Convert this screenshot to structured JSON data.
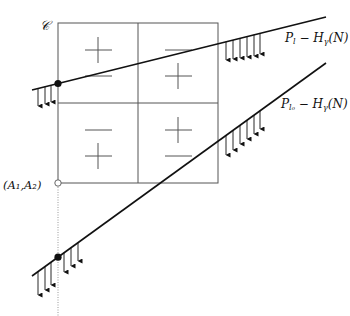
{
  "diagram": {
    "curve_label": "𝒞",
    "point_label": "(A₁,A₂)",
    "line_top": {
      "label_main": "P",
      "label_sub": "l",
      "label_rest": " − H",
      "label_rest_sub": "γ",
      "label_tail": "(N)"
    },
    "line_bottom": {
      "label_main": "P",
      "label_sub": "l₀",
      "label_rest": " − H",
      "label_rest_sub": "γ",
      "label_tail": "(N)"
    },
    "quadrants": {
      "top_left": [
        "+",
        "−"
      ],
      "top_right": [
        "−",
        "+"
      ],
      "bottom_left": [
        "−",
        "+"
      ],
      "bottom_right": [
        "+",
        "−"
      ]
    },
    "colors": {
      "ink": "#111111",
      "grid": "#555555",
      "dotted": "#999999"
    }
  }
}
